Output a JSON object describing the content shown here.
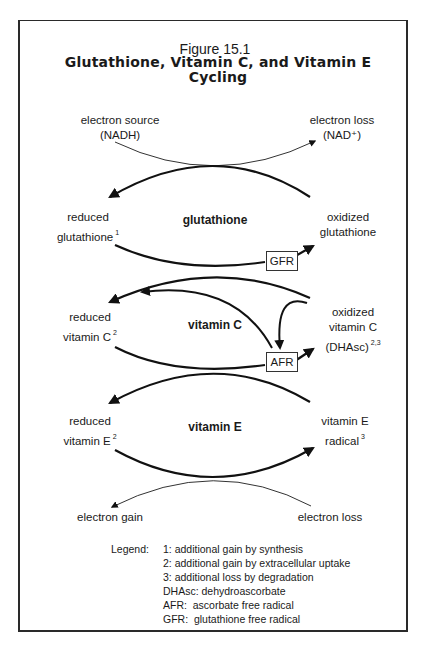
{
  "figure": {
    "number": "Figure 15.1",
    "title": "Glutathione, Vitamin C, and Vitamin E Cycling"
  },
  "top": {
    "left_label": [
      "electron source",
      "(NADH)"
    ],
    "right_label": [
      "electron loss",
      "(NAD⁺)"
    ]
  },
  "glutathione": {
    "center": "glutathione",
    "left": [
      "reduced",
      "glutathione"
    ],
    "left_sup": "1",
    "right": [
      "oxidized",
      "glutathione"
    ],
    "box": "GFR"
  },
  "vitamin_c": {
    "center": "vitamin C",
    "left": [
      "reduced",
      "vitamin C"
    ],
    "left_sup": "2",
    "right": [
      "oxidized",
      "vitamin C",
      "(DHAsc)"
    ],
    "right_sup": "2,3",
    "box": "AFR"
  },
  "vitamin_e": {
    "center": "vitamin E",
    "left": [
      "reduced",
      "vitamin E"
    ],
    "left_sup": "2",
    "right": [
      "vitamin E",
      "radical"
    ],
    "right_sup": "3"
  },
  "bottom": {
    "left_label": "electron gain",
    "right_label": "electron loss"
  },
  "legend": {
    "heading": "Legend:",
    "items": [
      "1: additional gain by synthesis",
      "2: additional gain by extracellular uptake",
      "3: additional loss by degradation",
      "DHAsc: dehydroascorbate",
      "AFR:  ascorbate free radical",
      "GFR:  glutathione free radical"
    ]
  }
}
